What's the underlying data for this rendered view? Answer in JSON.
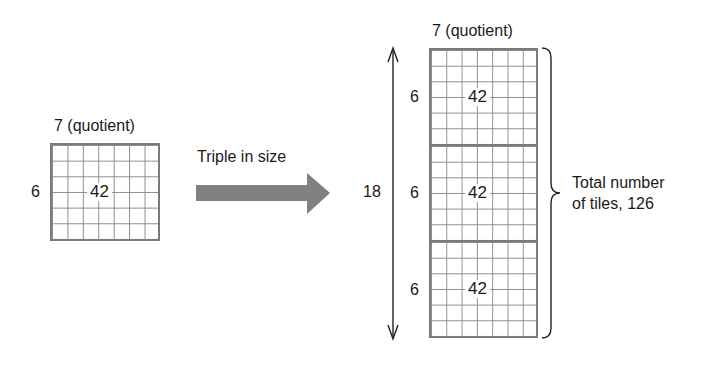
{
  "left_figure": {
    "top_label": "7 (quotient)",
    "side_label": "6",
    "center_value": "42",
    "columns": 7,
    "rows": 6
  },
  "transform_arrow": {
    "label": "Triple in size",
    "color": "#808080"
  },
  "right_figure": {
    "top_label": "7 (quotient)",
    "height_label": "18",
    "blocks": [
      {
        "side_label": "6",
        "center_value": "42"
      },
      {
        "side_label": "6",
        "center_value": "42"
      },
      {
        "side_label": "6",
        "center_value": "42"
      }
    ],
    "columns": 7,
    "rows_per_block": 6,
    "brace_label_line1": "Total number",
    "brace_label_line2": "of tiles, 126"
  }
}
